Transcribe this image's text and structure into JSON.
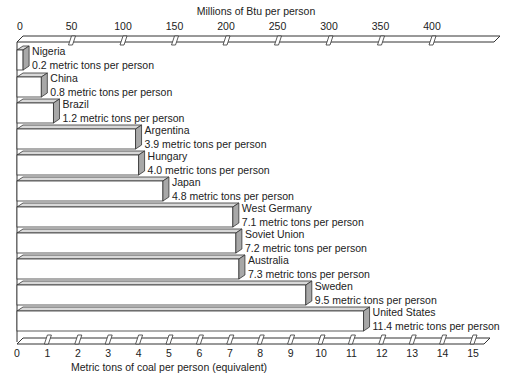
{
  "chart_data": {
    "type": "bar",
    "orientation": "horizontal",
    "title": "",
    "top_axis": {
      "label": "Millions of Btu per person",
      "ticks": [
        0,
        50,
        100,
        150,
        200,
        250,
        300,
        350,
        400
      ],
      "range": [
        0,
        425
      ]
    },
    "bottom_axis": {
      "label": "Metric tons of coal per person (equivalent)",
      "ticks": [
        0,
        1,
        2,
        3,
        4,
        5,
        6,
        7,
        8,
        9,
        10,
        11,
        12,
        13,
        14,
        15
      ],
      "range": [
        0,
        15.5
      ]
    },
    "xlabel": "Metric tons of coal per person (equivalent)",
    "ylabel": "",
    "unit_suffix": "metric tons per person",
    "categories": [
      "Nigeria",
      "China",
      "Brazil",
      "Argentina",
      "Hungary",
      "Japan",
      "West Germany",
      "Soviet Union",
      "Australia",
      "Sweden",
      "United States"
    ],
    "values": [
      0.2,
      0.8,
      1.2,
      3.9,
      4.0,
      4.8,
      7.1,
      7.2,
      7.3,
      9.5,
      11.4
    ],
    "value_labels": [
      "0.2 metric tons per person",
      "0.8 metric tons per person",
      "1.2 metric tons per person",
      "3.9 metric tons per person",
      "4.0 metric tons per person",
      "4.8 metric tons per person",
      "7.1 metric tons per person",
      "7.2 metric tons per person",
      "7.3 metric tons per person",
      "9.5 metric tons per person",
      "11.4 metric tons per person"
    ],
    "grid": false,
    "legend": null,
    "style": "3d-bars"
  },
  "colors": {
    "bar_face": "#ffffff",
    "bar_side": "#a8a8a8",
    "bar_top": "#d8d8d8",
    "stroke": "#333333",
    "text": "#222222"
  }
}
